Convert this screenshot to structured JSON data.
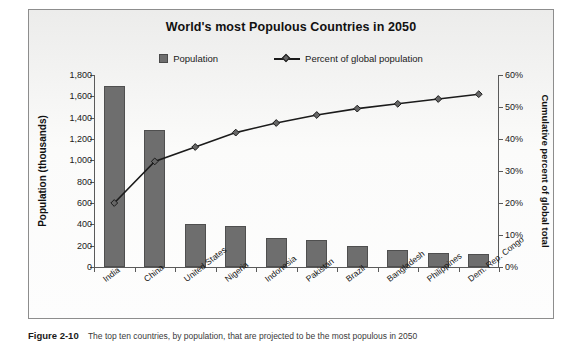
{
  "chart_data": {
    "type": "bar",
    "title": "World's most Populous Countries in 2050",
    "xlabel": "",
    "ylabel": "Population (thousands)",
    "y2label": "Cumulative percent of global total",
    "ylim": [
      0,
      1800
    ],
    "y2lim": [
      0,
      60
    ],
    "grid": false,
    "legend_position": "top-center",
    "categories": [
      "India",
      "China",
      "United States",
      "Nigeria",
      "Indonesia",
      "Pakistan",
      "Brazil",
      "Bangladesh",
      "Philippines",
      "Dem. Rep. Congo"
    ],
    "series": [
      {
        "name": "Population",
        "type": "bar",
        "axis": "left",
        "unit": "thousands",
        "values": [
          1700,
          1285,
          400,
          385,
          275,
          255,
          195,
          160,
          130,
          120
        ]
      },
      {
        "name": "Percent of global population",
        "type": "line",
        "axis": "right",
        "unit": "percent",
        "values": [
          20,
          33,
          37.5,
          42,
          45,
          47.5,
          49.5,
          51,
          52.5,
          54
        ]
      }
    ],
    "y_ticks": [
      "0",
      "200",
      "400",
      "600",
      "800",
      "1,000",
      "1,200",
      "1,400",
      "1,600",
      "1,800"
    ],
    "y2_ticks": [
      "0%",
      "10%",
      "20%",
      "30%",
      "40%",
      "50%",
      "60%"
    ],
    "colors": {
      "bar": "#6e6e6e",
      "bar_border": "#4f4f4f",
      "line": "#1b1b1b",
      "marker": "#666666",
      "axis": "#5a5a5a",
      "plot_background": "#fbfbfa",
      "frame_border": "#8d8d8d"
    }
  },
  "legend": {
    "items": [
      {
        "label": "Population",
        "marker": "square-swatch"
      },
      {
        "label": "Percent of global population",
        "marker": "line-diamond"
      }
    ]
  },
  "caption": {
    "label": "Figure 2-10",
    "text": "The top ten countries, by population, that are projected to be the most populous in 2050"
  }
}
